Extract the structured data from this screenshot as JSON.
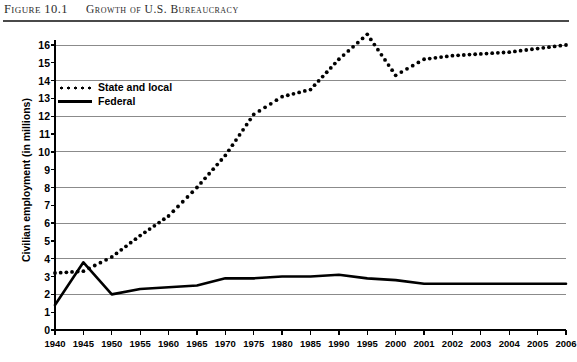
{
  "header": {
    "figure_label": "Figure 10.1",
    "title": "Growth of U.S. Bureaucracy"
  },
  "chart_data": {
    "type": "line",
    "title": "Growth of U.S. Bureaucracy",
    "xlabel": "",
    "ylabel": "Civilian employment (in millions)",
    "ylim": [
      0,
      16
    ],
    "ytick_labels": [
      "0",
      "1",
      "2",
      "3",
      "4",
      "5",
      "6",
      "7",
      "8",
      "9",
      "10",
      "11",
      "12",
      "13",
      "14",
      "15",
      "16"
    ],
    "gridlines_at": [
      0,
      2,
      4,
      6,
      8,
      10,
      12,
      14,
      16
    ],
    "grid": true,
    "legend_position": "upper-left-inside",
    "categories": [
      "1940",
      "1945",
      "1950",
      "1955",
      "1960",
      "1965",
      "1970",
      "1975",
      "1980",
      "1985",
      "1990",
      "1995",
      "2000",
      "2001",
      "2002",
      "2003",
      "2004",
      "2005",
      "2006"
    ],
    "series": [
      {
        "name": "State and local",
        "style": "dotted",
        "color": "#000000",
        "values": [
          3.2,
          3.3,
          4.1,
          5.3,
          6.4,
          8.0,
          9.8,
          12.1,
          13.1,
          13.5,
          15.2,
          16.6,
          14.3,
          15.2,
          15.4,
          15.5,
          15.6,
          15.8,
          16.0
        ]
      },
      {
        "name": "Federal",
        "style": "solid",
        "color": "#000000",
        "values": [
          1.4,
          3.8,
          2.0,
          2.3,
          2.4,
          2.5,
          2.9,
          2.9,
          3.0,
          3.0,
          3.1,
          2.9,
          2.8,
          2.6,
          2.6,
          2.6,
          2.6,
          2.6,
          2.6
        ]
      }
    ]
  }
}
